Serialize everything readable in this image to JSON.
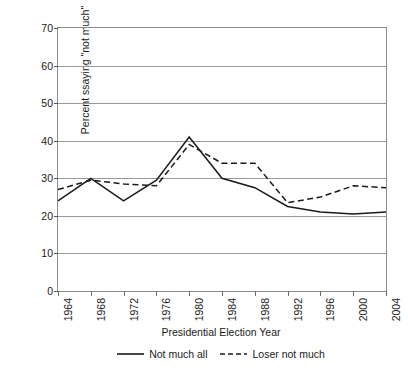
{
  "top_caption_fragment": "",
  "chart_data": {
    "type": "line",
    "title": "",
    "xlabel": "Presidential Election Year",
    "ylabel": "Percent ssaying \"not much\"",
    "grid": true,
    "legend_position": "bottom-center",
    "xlim": [
      1964,
      2004
    ],
    "ylim": [
      0,
      70
    ],
    "ytick_step": 10,
    "yticks": [
      0,
      10,
      20,
      30,
      40,
      50,
      60,
      70
    ],
    "ytick_labels": [
      "0",
      "10",
      "20",
      "30",
      "40",
      "50",
      "60",
      "70"
    ],
    "categories": [
      1964,
      1968,
      1972,
      1976,
      1980,
      1984,
      1988,
      1992,
      1996,
      2000,
      2004
    ],
    "xtick_labels": [
      "1964",
      "1968",
      "1972",
      "1976",
      "1980",
      "1984",
      "1988",
      "1992",
      "1996",
      "2000",
      "2004"
    ],
    "series": [
      {
        "name": "Not much all",
        "style": "solid",
        "color": "#1a1a1a",
        "values": [
          24,
          30,
          24,
          29.5,
          41,
          30,
          27.5,
          22.5,
          21,
          20.5,
          21
        ]
      },
      {
        "name": "Loser not much",
        "style": "dashed",
        "color": "#1a1a1a",
        "values": [
          27,
          29.5,
          28.5,
          28,
          39,
          34,
          34,
          23.5,
          25,
          28,
          27.5
        ]
      }
    ]
  }
}
